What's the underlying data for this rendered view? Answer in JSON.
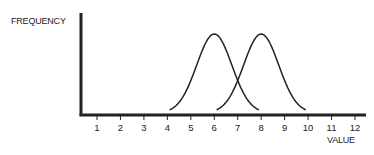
{
  "chart_data": {
    "type": "line",
    "title": "",
    "xlabel": "VALUE",
    "ylabel": "FREQUENCY",
    "x_ticks": [
      1,
      2,
      3,
      4,
      5,
      6,
      7,
      8,
      9,
      10,
      11,
      12
    ],
    "xlim": [
      0,
      12.4
    ],
    "ylim": [
      0,
      1
    ],
    "grid": false,
    "legend": null,
    "series": [
      {
        "name": "distribution-1",
        "shape": "normal",
        "mean": 6,
        "x_range": [
          4.1,
          7.9
        ],
        "peak_relative_height": 0.8
      },
      {
        "name": "distribution-2",
        "shape": "normal",
        "mean": 8,
        "x_range": [
          6.1,
          9.9
        ],
        "peak_relative_height": 0.8
      }
    ],
    "annotations": [
      "Curves intersect near VALUE 7"
    ]
  },
  "colors": {
    "ink": "#222222",
    "background": "#ffffff"
  }
}
